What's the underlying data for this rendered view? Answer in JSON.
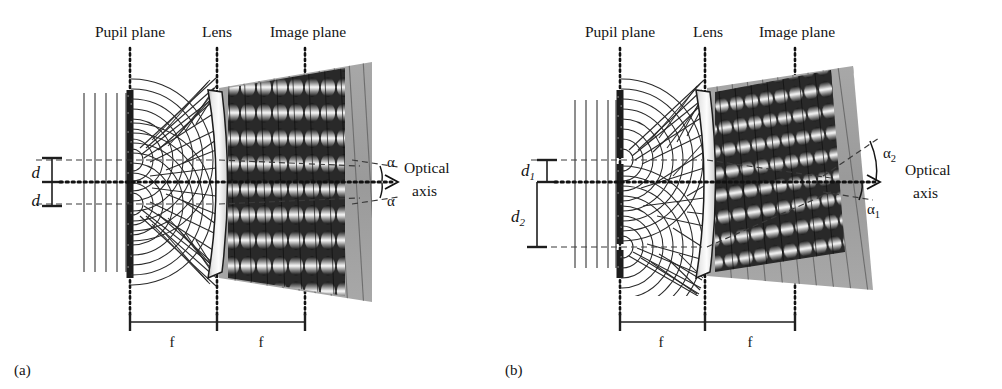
{
  "figure": {
    "background_color": "#ffffff",
    "ink_color": "#1a1a1a"
  },
  "panels": [
    {
      "id": "a",
      "caption": "(a)",
      "labels": {
        "pupil_plane": "Pupil plane",
        "lens": "Lens",
        "image_plane": "Image plane",
        "optical_axis_line1": "Optical",
        "optical_axis_line2": "axis",
        "aperture_upper": "d",
        "aperture_lower": "d",
        "angle_upper": "α",
        "angle_lower": "α",
        "focal_left": "f",
        "focal_right": "f"
      },
      "geometry": {
        "pupil_plane_x": 130,
        "lens_x": 217,
        "image_plane_x": 305,
        "optical_axis_y": 182,
        "slit_offset_upper": 22,
        "slit_offset_lower": 22,
        "alpha_upper_deg": 8,
        "alpha_lower_deg": 8,
        "plane_wave_count": 5
      }
    },
    {
      "id": "b",
      "caption": "(b)",
      "labels": {
        "pupil_plane": "Pupil plane",
        "lens": "Lens",
        "image_plane": "Image plane",
        "optical_axis_line1": "Optical",
        "optical_axis_line2": "axis",
        "aperture_upper": "d",
        "aperture_upper_sub": "1",
        "aperture_lower": "d",
        "aperture_lower_sub": "2",
        "angle_upper": "α",
        "angle_upper_sub": "2",
        "angle_lower": "α",
        "angle_lower_sub": "1",
        "focal_left": "f",
        "focal_right": "f"
      },
      "geometry": {
        "pupil_plane_x": 119,
        "lens_x": 204,
        "image_plane_x": 294,
        "optical_axis_y": 182,
        "slit_offset_upper": 22,
        "slit_offset_lower": 74,
        "alpha_upper_deg": 25,
        "alpha_lower_deg": 11,
        "plane_wave_count": 5
      }
    }
  ]
}
